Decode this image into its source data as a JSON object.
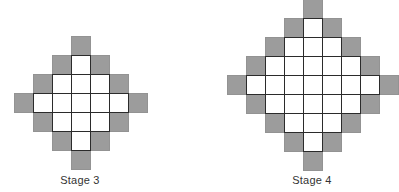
{
  "colors": {
    "gray_cell": "#9c9c9c",
    "white_cell": "#ffffff",
    "grid_line": "#2b2b2b",
    "label_text": "#333333"
  },
  "figures": [
    {
      "label": "Stage 3",
      "origin_x": 14,
      "origin_y": 36,
      "cell_size": 19,
      "label_x": 80,
      "label_y": 174,
      "rows": [
        "...G...",
        "..GWG..",
        ".GWWWG.",
        "GWWWWWG",
        ".GWWWG.",
        "..GWG..",
        "...G..."
      ]
    },
    {
      "label": "Stage 4",
      "origin_x": 227,
      "origin_y": -1,
      "cell_size": 19,
      "label_x": 312,
      "label_y": 174,
      "rows": [
        "....G....",
        "...GWG...",
        "..GWWWG..",
        ".GWWWWWG.",
        "GWWWWWWWG",
        ".GWWWWWG.",
        "..GWWWG..",
        "...GWG...",
        "....G...."
      ]
    }
  ]
}
